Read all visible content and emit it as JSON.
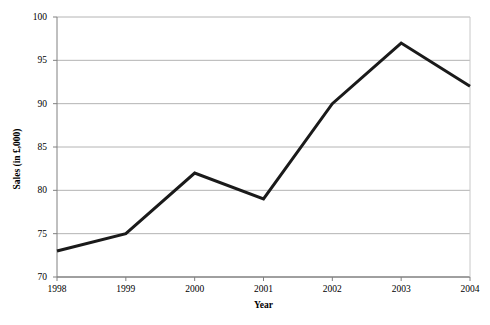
{
  "chart_data": {
    "type": "line",
    "title": "",
    "xlabel": "Year",
    "ylabel": "Sales (in £,000)",
    "categories": [
      "1998",
      "1999",
      "2000",
      "2001",
      "2002",
      "2003",
      "2004"
    ],
    "x": [
      1998,
      1999,
      2000,
      2001,
      2002,
      2003,
      2004
    ],
    "values": [
      73,
      75,
      82,
      79,
      90,
      97,
      92
    ],
    "series": [
      {
        "name": "Sales",
        "values": [
          73,
          75,
          82,
          79,
          90,
          97,
          92
        ]
      }
    ],
    "ylim": [
      70,
      100
    ],
    "yticks": [
      70,
      75,
      80,
      85,
      90,
      95,
      100
    ],
    "ytick_labels": [
      "70",
      "75",
      "80",
      "85",
      "90",
      "95",
      "100"
    ],
    "xtick_labels": [
      "1998",
      "1999",
      "2000",
      "2001",
      "2002",
      "2003",
      "2004"
    ],
    "grid": "horizontal",
    "legend": "none",
    "markers": "none",
    "line_color": "#1a1a1a",
    "line_width": 3,
    "grid_color": "#b4b4b4",
    "axis_color": "#808080",
    "background": "#ffffff"
  }
}
